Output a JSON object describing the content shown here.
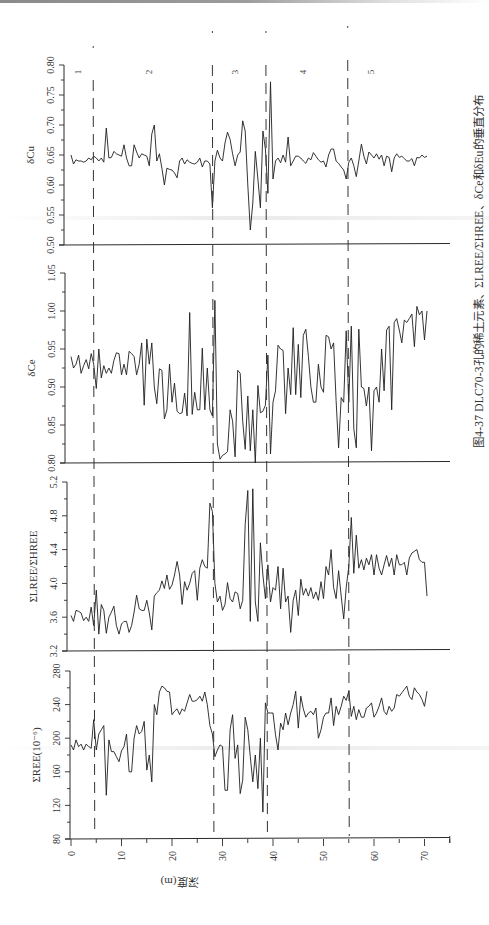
{
  "figure": {
    "caption": "图4-37  DLC70-3孔的稀土元素、ΣLREE/ΣHREE、δCe和δEu的垂直分布",
    "x_axis_label": "深度(m)",
    "zone_labels": [
      "1",
      "2",
      "3",
      "4",
      "5"
    ]
  },
  "chart_data": [
    {
      "type": "line",
      "title": "δCu",
      "xlabel": "深度(m)",
      "ylabel": "δCu",
      "xlim": [
        0,
        75
      ],
      "ylim": [
        0.5,
        0.8
      ],
      "yticks": [
        "0.50",
        "0.55",
        "0.60",
        "0.65",
        "0.70",
        "0.75",
        "0.80"
      ],
      "grid": false,
      "x": [
        0,
        0.5,
        1,
        1.5,
        2,
        2.5,
        3,
        3.5,
        4,
        4.5,
        5,
        5.5,
        6,
        6.5,
        7,
        7.5,
        8,
        8.5,
        9,
        9.5,
        10,
        10.5,
        11,
        11.5,
        12,
        12.5,
        13,
        13.5,
        14,
        14.5,
        15,
        15.5,
        16,
        16.5,
        17,
        17.5,
        18,
        18.5,
        19,
        19.5,
        20,
        20.5,
        21,
        21.5,
        22,
        22.5,
        23,
        23.5,
        24,
        24.5,
        25,
        25.5,
        26,
        26.5,
        27,
        27.5,
        28,
        28.5,
        29,
        29.5,
        30,
        30.5,
        31,
        31.5,
        32,
        32.5,
        33,
        33.5,
        34,
        34.5,
        35,
        35.5,
        36,
        36.5,
        37,
        37.5,
        38,
        38.5,
        39,
        39.5,
        40,
        40.5,
        41,
        41.5,
        42,
        42.5,
        43,
        43.5,
        44,
        44.5,
        45,
        45.5,
        46,
        46.5,
        47,
        47.5,
        48,
        48.5,
        49,
        49.5,
        50,
        50.5,
        51,
        51.5,
        52,
        52.5,
        53,
        53.5,
        54,
        54.5,
        55,
        55.5,
        56,
        56.5,
        57,
        57.5,
        58,
        58.5,
        59,
        59.5,
        60,
        60.5,
        61,
        61.5,
        62,
        62.5,
        63,
        63.5,
        64,
        64.5,
        65,
        65.5,
        66,
        66.5,
        67,
        67.5,
        68,
        68.5,
        69,
        69.5,
        70,
        70.5
      ],
      "values": [
        0.65,
        0.635,
        0.642,
        0.64,
        0.64,
        0.638,
        0.64,
        0.645,
        0.642,
        0.648,
        0.645,
        0.64,
        0.645,
        0.638,
        0.695,
        0.645,
        0.646,
        0.656,
        0.652,
        0.65,
        0.648,
        0.667,
        0.645,
        0.632,
        0.632,
        0.667,
        0.655,
        0.645,
        0.652,
        0.65,
        0.648,
        0.632,
        0.685,
        0.7,
        0.64,
        0.652,
        0.628,
        0.6,
        0.628,
        0.626,
        0.625,
        0.62,
        0.612,
        0.64,
        0.645,
        0.635,
        0.642,
        0.638,
        0.636,
        0.635,
        0.638,
        0.645,
        0.63,
        0.64,
        0.64,
        0.635,
        0.562,
        0.64,
        0.658,
        0.645,
        0.64,
        0.67,
        0.688,
        0.676,
        0.652,
        0.632,
        0.65,
        0.655,
        0.707,
        0.69,
        0.6,
        0.525,
        0.57,
        0.656,
        0.61,
        0.562,
        0.69,
        0.66,
        0.586,
        0.772,
        0.61,
        0.64,
        0.645,
        0.637,
        0.65,
        0.638,
        0.68,
        0.632,
        0.64,
        0.648,
        0.648,
        0.645,
        0.64,
        0.636,
        0.645,
        0.642,
        0.654,
        0.648,
        0.642,
        0.638,
        0.64,
        0.63,
        0.65,
        0.66,
        0.66,
        0.64,
        0.636,
        0.63,
        0.625,
        0.61,
        0.638,
        0.645,
        0.632,
        0.614,
        0.64,
        0.668,
        0.648,
        0.635,
        0.655,
        0.65,
        0.645,
        0.652,
        0.643,
        0.65,
        0.632,
        0.648,
        0.646,
        0.622,
        0.645,
        0.652,
        0.646,
        0.648,
        0.644,
        0.64,
        0.64,
        0.644,
        0.632,
        0.646,
        0.645,
        0.65,
        0.646,
        0.648,
        0.602,
        0.628,
        0.628,
        0.598
      ]
    },
    {
      "type": "line",
      "title": "δCe",
      "xlabel": "深度(m)",
      "ylabel": "δCe",
      "xlim": [
        0,
        75
      ],
      "ylim": [
        0.8,
        1.05
      ],
      "yticks": [
        "0.80",
        "0.85",
        "0.90",
        "0.95",
        "1.00",
        "1.05"
      ],
      "grid": false,
      "x": [
        0,
        0.5,
        1,
        1.5,
        2,
        2.5,
        3,
        3.5,
        4,
        4.5,
        5,
        5.5,
        6,
        6.5,
        7,
        7.5,
        8,
        8.5,
        9,
        9.5,
        10,
        10.5,
        11,
        11.5,
        12,
        12.5,
        13,
        13.5,
        14,
        14.5,
        15,
        15.5,
        16,
        16.5,
        17,
        17.5,
        18,
        18.5,
        19,
        19.5,
        20,
        20.5,
        21,
        21.5,
        22,
        22.5,
        23,
        23.5,
        24,
        24.5,
        25,
        25.5,
        26,
        26.5,
        27,
        27.5,
        28,
        28.5,
        29,
        29.5,
        30,
        30.5,
        31,
        31.5,
        32,
        32.5,
        33,
        33.5,
        34,
        34.5,
        35,
        35.5,
        36,
        36.5,
        37,
        37.5,
        38,
        38.5,
        39,
        39.5,
        40,
        40.5,
        41,
        41.5,
        42,
        42.5,
        43,
        43.5,
        44,
        44.5,
        45,
        45.5,
        46,
        46.5,
        47,
        47.5,
        48,
        48.5,
        49,
        49.5,
        50,
        50.5,
        51,
        51.5,
        52,
        52.5,
        53,
        53.5,
        54,
        54.5,
        55,
        55.5,
        56,
        56.5,
        57,
        57.5,
        58,
        58.5,
        59,
        59.5,
        60,
        60.5,
        61,
        61.5,
        62,
        62.5,
        63,
        63.5,
        64,
        64.5,
        65,
        65.5,
        66,
        66.5,
        67,
        67.5,
        68,
        68.5,
        69,
        69.5,
        70,
        70.5
      ],
      "values": [
        0.94,
        0.925,
        0.93,
        0.942,
        0.918,
        0.928,
        0.936,
        0.924,
        0.944,
        0.93,
        0.898,
        0.95,
        0.912,
        0.928,
        0.918,
        0.925,
        0.918,
        0.935,
        0.945,
        0.944,
        0.916,
        0.93,
        0.916,
        0.947,
        0.944,
        0.94,
        0.916,
        0.93,
        0.958,
        0.876,
        0.963,
        0.93,
        0.958,
        0.9,
        0.878,
        0.924,
        0.922,
        0.858,
        0.87,
        0.93,
        0.88,
        0.905,
        0.868,
        0.865,
        0.866,
        0.892,
        0.862,
        0.998,
        0.864,
        0.893,
        0.87,
        0.87,
        0.951,
        0.87,
        0.925,
        0.87,
        0.862,
        1.014,
        0.825,
        0.805,
        0.81,
        0.812,
        0.815,
        0.87,
        0.855,
        0.808,
        0.922,
        0.918,
        0.855,
        0.818,
        0.888,
        0.816,
        0.87,
        0.8,
        0.902,
        0.866,
        0.868,
        0.876,
        0.942,
        0.812,
        0.88,
        0.895,
        0.955,
        0.95,
        0.948,
        0.865,
        0.925,
        0.89,
        0.978,
        0.89,
        0.956,
        0.886,
        0.968,
        0.976,
        0.94,
        0.9,
        0.88,
        0.88,
        0.93,
        0.9,
        0.893,
        0.968,
        0.966,
        0.95,
        0.958,
        0.882,
        0.82,
        0.886,
        0.88,
        0.974,
        0.88,
        0.98,
        0.845,
        0.82,
        0.976,
        0.9,
        0.898,
        0.875,
        0.9,
        0.816,
        0.895,
        0.9,
        0.88,
        0.95,
        0.895,
        0.975,
        0.98,
        0.87,
        0.985,
        0.99,
        0.975,
        0.958,
        0.988,
        0.985,
        0.99,
        0.996,
        0.953,
        1.006,
        0.995,
        1.0,
        0.962,
        1.0,
        0.922,
        0.91,
        0.908,
        0.948,
        0.915,
        0.92
      ]
    },
    {
      "type": "line",
      "title": "ΣLREE/ΣHREE",
      "xlabel": "深度(m)",
      "ylabel": "ΣLREE/ΣHREE",
      "xlim": [
        0,
        75
      ],
      "ylim": [
        3.2,
        5.2
      ],
      "yticks": [
        "3.2",
        "3.6",
        "4.0",
        "4.4",
        "4.8",
        "5.2"
      ],
      "grid": false,
      "x": [
        0,
        0.5,
        1,
        1.5,
        2,
        2.5,
        3,
        3.5,
        4,
        4.5,
        5,
        5.5,
        6,
        6.5,
        7,
        7.5,
        8,
        8.5,
        9,
        9.5,
        10,
        10.5,
        11,
        11.5,
        12,
        12.5,
        13,
        13.5,
        14,
        14.5,
        15,
        15.5,
        16,
        16.5,
        17,
        17.5,
        18,
        18.5,
        19,
        19.5,
        20,
        20.5,
        21,
        21.5,
        22,
        22.5,
        23,
        23.5,
        24,
        24.5,
        25,
        25.5,
        26,
        26.5,
        27,
        27.5,
        28,
        28.5,
        29,
        29.5,
        30,
        30.5,
        31,
        31.5,
        32,
        32.5,
        33,
        33.5,
        34,
        34.5,
        35,
        35.5,
        36,
        36.5,
        37,
        37.5,
        38,
        38.5,
        39,
        39.5,
        40,
        40.5,
        41,
        41.5,
        42,
        42.5,
        43,
        43.5,
        44,
        44.5,
        45,
        45.5,
        46,
        46.5,
        47,
        47.5,
        48,
        48.5,
        49,
        49.5,
        50,
        50.5,
        51,
        51.5,
        52,
        52.5,
        53,
        53.5,
        54,
        54.5,
        55,
        55.5,
        56,
        56.5,
        57,
        57.5,
        58,
        58.5,
        59,
        59.5,
        60,
        60.5,
        61,
        61.5,
        62,
        62.5,
        63,
        63.5,
        64,
        64.5,
        65,
        65.5,
        66,
        66.5,
        67,
        67.5,
        68,
        68.5,
        69,
        69.5,
        70,
        70.5
      ],
      "values": [
        3.62,
        3.55,
        3.68,
        3.67,
        3.65,
        3.56,
        3.6,
        3.55,
        3.72,
        3.5,
        3.92,
        3.4,
        3.75,
        3.68,
        3.41,
        3.6,
        3.66,
        3.73,
        3.5,
        3.4,
        3.52,
        3.55,
        3.55,
        3.42,
        3.5,
        3.66,
        3.86,
        3.7,
        3.68,
        3.68,
        3.8,
        3.65,
        3.45,
        3.85,
        3.89,
        3.92,
        4.03,
        3.94,
        4.1,
        3.93,
        3.98,
        4.1,
        4.26,
        4.1,
        3.75,
        4.02,
        3.92,
        4.0,
        4.12,
        4.15,
        3.8,
        4.18,
        4.28,
        4.2,
        4.18,
        4.95,
        4.85,
        4.0,
        3.78,
        3.85,
        3.68,
        3.75,
        4.01,
        3.82,
        3.78,
        3.9,
        3.88,
        3.7,
        3.8,
        4.7,
        5.1,
        3.55,
        5.12,
        3.78,
        3.55,
        4.48,
        4.1,
        3.82,
        4.22,
        3.78,
        3.95,
        3.92,
        4.2,
        3.7,
        4.18,
        3.78,
        3.85,
        3.42,
        3.8,
        3.92,
        3.62,
        4.05,
        3.86,
        3.94,
        3.85,
        3.95,
        3.82,
        3.9,
        3.8,
        4.02,
        3.82,
        4.2,
        4.1,
        4.4,
        3.95,
        3.82,
        4.15,
        3.85,
        3.58,
        3.95,
        4.2,
        4.78,
        4.12,
        4.57,
        4.18,
        4.28,
        4.16,
        4.3,
        4.22,
        4.34,
        4.1,
        4.34,
        4.18,
        4.1,
        4.22,
        4.33,
        4.2,
        4.3,
        4.1,
        4.34,
        4.22,
        4.22,
        4.25,
        4.1,
        4.3,
        4.36,
        4.38,
        4.4,
        4.28,
        4.25,
        4.25,
        3.85,
        3.95,
        4.06,
        4.06
      ]
    },
    {
      "type": "line",
      "title": "ΣREE(10⁻⁶)",
      "xlabel": "深度(m)",
      "ylabel": "ΣREE(10⁻⁶)",
      "xlim": [
        0,
        75
      ],
      "ylim": [
        80,
        280
      ],
      "yticks": [
        "80",
        "120",
        "160",
        "200",
        "240",
        "280"
      ],
      "xticks": [
        "0",
        "10",
        "20",
        "30",
        "40",
        "50",
        "60",
        "70"
      ],
      "grid": false,
      "x": [
        0,
        0.5,
        1,
        1.5,
        2,
        2.5,
        3,
        3.5,
        4,
        4.5,
        5,
        5.5,
        6,
        6.5,
        7,
        7.5,
        8,
        8.5,
        9,
        9.5,
        10,
        10.5,
        11,
        11.5,
        12,
        12.5,
        13,
        13.5,
        14,
        14.5,
        15,
        15.5,
        16,
        16.5,
        17,
        17.5,
        18,
        18.5,
        19,
        19.5,
        20,
        20.5,
        21,
        21.5,
        22,
        22.5,
        23,
        23.5,
        24,
        24.5,
        25,
        25.5,
        26,
        26.5,
        27,
        27.5,
        28,
        28.5,
        29,
        29.5,
        30,
        30.5,
        31,
        31.5,
        32,
        32.5,
        33,
        33.5,
        34,
        34.5,
        35,
        35.5,
        36,
        36.5,
        37,
        37.5,
        38,
        38.5,
        39,
        39.5,
        40,
        40.5,
        41,
        41.5,
        42,
        42.5,
        43,
        43.5,
        44,
        44.5,
        45,
        45.5,
        46,
        46.5,
        47,
        47.5,
        48,
        48.5,
        49,
        49.5,
        50,
        50.5,
        51,
        51.5,
        52,
        52.5,
        53,
        53.5,
        54,
        54.5,
        55,
        55.5,
        56,
        56.5,
        57,
        57.5,
        58,
        58.5,
        59,
        59.5,
        60,
        60.5,
        61,
        61.5,
        62,
        62.5,
        63,
        63.5,
        64,
        64.5,
        65,
        65.5,
        66,
        66.5,
        67,
        67.5,
        68,
        68.5,
        69,
        69.5,
        70,
        70.5
      ],
      "values": [
        192,
        186,
        198,
        190,
        193,
        186,
        193,
        190,
        188,
        222,
        186,
        205,
        210,
        215,
        132,
        198,
        184,
        184,
        178,
        172,
        185,
        190,
        205,
        160,
        160,
        200,
        215,
        205,
        208,
        220,
        162,
        180,
        148,
        240,
        228,
        255,
        262,
        260,
        256,
        255,
        228,
        232,
        235,
        228,
        235,
        232,
        242,
        252,
        244,
        244,
        246,
        250,
        244,
        255,
        240,
        215,
        205,
        178,
        186,
        192,
        190,
        138,
        138,
        210,
        228,
        176,
        192,
        134,
        150,
        225,
        210,
        178,
        148,
        180,
        140,
        200,
        112,
        242,
        230,
        230,
        230,
        204,
        186,
        218,
        210,
        230,
        216,
        230,
        240,
        256,
        212,
        250,
        235,
        225,
        230,
        232,
        228,
        236,
        200,
        210,
        225,
        230,
        230,
        248,
        215,
        238,
        228,
        238,
        250,
        245,
        256,
        226,
        238,
        222,
        234,
        225,
        225,
        236,
        238,
        242,
        225,
        230,
        238,
        248,
        232,
        228,
        238,
        232,
        236,
        252,
        250,
        254,
        258,
        262,
        250,
        246,
        260,
        255,
        252,
        246,
        238,
        256
      ]
    }
  ]
}
